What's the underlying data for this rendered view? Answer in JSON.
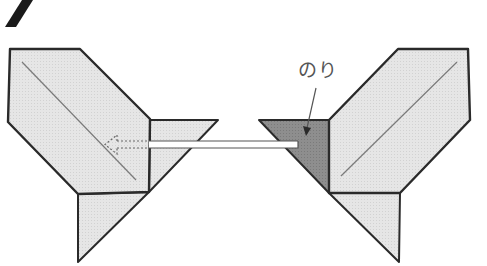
{
  "step": {
    "number": "7"
  },
  "labels": {
    "glue": "のり"
  },
  "colors": {
    "paper": "#e3e3e3",
    "glue_area": "#8c8c8c",
    "outline": "#2a2a2a",
    "crease": "#7a7a7a",
    "arrow_fill": "#ffffff",
    "arrow_outline": "#555555",
    "step_mark": "#1a1a1a",
    "label": "#555555"
  },
  "figures": {
    "left": {
      "main_panel": "10,49 80,49 150,119 149,192 78,194 8,122",
      "flap_triangle": "150,120 218,120 149,192",
      "bottom_triangle": "78,194 149,192 78,262",
      "crease_line": [
        22,
        62,
        136,
        180
      ]
    },
    "right": {
      "glue_triangle": "259,120 329,120 329,193",
      "main_panel": "329,120 398,49 468,49 470,120 400,193 329,193",
      "bottom_triangle": "329,193 400,193 399,262",
      "crease_line": [
        341,
        176,
        457,
        62
      ]
    }
  },
  "arrow": {
    "direction": "left",
    "solid_from_x": 298,
    "solid_to_x": 149,
    "dashed_to_x": 118,
    "head_tip_x": 104,
    "y_top": 141,
    "y_bottom": 148
  },
  "pointer": {
    "from": [
      316,
      88
    ],
    "to": [
      306,
      132
    ]
  }
}
